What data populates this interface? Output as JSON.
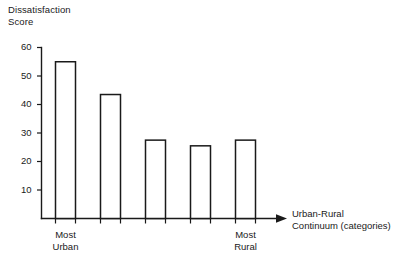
{
  "chart_data": {
    "type": "bar",
    "title": "",
    "ylabel": "Dissatisfaction\nScore",
    "ylabel_line1": "Dissatisfaction",
    "ylabel_line2": "Score",
    "xlabel": "Urban-Rural\nContinuum (categories)",
    "xlabel_line1": "Urban-Rural",
    "xlabel_line2": "Continuum (categories)",
    "categories": [
      "1",
      "2",
      "3",
      "4",
      "5"
    ],
    "values": [
      55,
      43.5,
      27.5,
      25.5,
      27.5
    ],
    "ylim": [
      0,
      60
    ],
    "yticks": [
      10,
      20,
      30,
      40,
      50,
      60
    ],
    "ytick_labels": [
      "10",
      "20",
      "30",
      "40",
      "50",
      "60"
    ],
    "grid": false,
    "legend": null,
    "legend_position": "none",
    "category_annotations": [
      {
        "category_index": 0,
        "line1": "Most",
        "line2": "Urban"
      },
      {
        "category_index": 4,
        "line1": "Most",
        "line2": "Rural"
      }
    ],
    "bar_style": "hollow-outline",
    "bar_fill": "#ffffff",
    "bar_stroke": "#1a1a1a",
    "axis_color": "#1a1a1a",
    "x_axis_has_arrow": true
  }
}
